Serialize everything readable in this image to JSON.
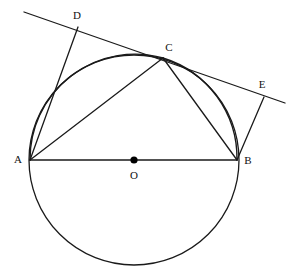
{
  "figure": {
    "width": 298,
    "height": 276,
    "background_color": "#ffffff",
    "stroke_color": "#1a1a1a",
    "label_color": "#111111",
    "stroke_width": 1.3
  },
  "circle": {
    "name": "circle-O",
    "center_x": 134,
    "center_y": 160,
    "radius": 105
  },
  "center_dot": {
    "name": "center-point-O",
    "x": 134,
    "y": 160,
    "radius": 3.6,
    "color": "#000000"
  },
  "points": {
    "A": {
      "label": "A",
      "x": 30,
      "y": 160,
      "label_x": 18,
      "label_y": 160
    },
    "B": {
      "label": "B",
      "x": 237,
      "y": 160,
      "label_x": 248,
      "label_y": 161
    },
    "C": {
      "label": "C",
      "x": 163,
      "y": 58,
      "label_x": 169,
      "label_y": 48
    },
    "D": {
      "label": "D",
      "x": 78,
      "y": 27,
      "label_x": 77,
      "label_y": 16
    },
    "E": {
      "label": "E",
      "x": 264,
      "y": 97,
      "label_x": 262,
      "label_y": 85
    },
    "O": {
      "label": "O",
      "x": 134,
      "y": 160,
      "label_x": 134,
      "label_y": 176
    }
  },
  "segments": [
    {
      "name": "segment-AB-diameter",
      "x1": 30,
      "y1": 160,
      "x2": 237,
      "y2": 160
    },
    {
      "name": "segment-AC",
      "x1": 30,
      "y1": 160,
      "x2": 163,
      "y2": 58
    },
    {
      "name": "segment-CB",
      "x1": 163,
      "y1": 58,
      "x2": 237,
      "y2": 160
    },
    {
      "name": "segment-AD",
      "x1": 30,
      "y1": 160,
      "x2": 78,
      "y2": 27
    },
    {
      "name": "segment-BE",
      "x1": 237,
      "y1": 160,
      "x2": 264,
      "y2": 97
    },
    {
      "name": "tangent-line-DCE",
      "x1": 24,
      "y1": 12,
      "x2": 285,
      "y2": 103
    }
  ],
  "arcs": [
    {
      "name": "arc-ACB-upper",
      "path": "M 30 160 A 105 105 0 0 1 163 58",
      "description": "upper circle arc from A to C"
    },
    {
      "name": "arc-CB-upper",
      "path": "M 163 58 A 105 105 0 0 1 237 160",
      "description": "upper circle arc from C to B"
    }
  ],
  "labels": {
    "A": "A",
    "B": "B",
    "C": "C",
    "D": "D",
    "E": "E",
    "O": "O"
  }
}
